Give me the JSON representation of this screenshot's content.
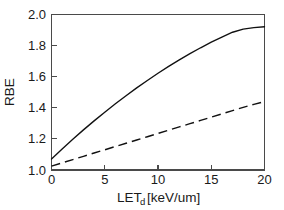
{
  "chart_data": {
    "type": "line",
    "title": "",
    "subtitle": "",
    "xlabel": "LET",
    "xlabel_subscript": "d",
    "xlabel_units": "[keV/um]",
    "ylabel": "RBE",
    "xlim": [
      0,
      20
    ],
    "ylim": [
      1.0,
      2.0
    ],
    "xticks": [
      0,
      5,
      10,
      15,
      20
    ],
    "yticks": [
      1.0,
      1.2,
      1.4,
      1.6,
      1.8,
      2.0
    ],
    "xticklabels": [
      "0",
      "5",
      "10",
      "15",
      "20"
    ],
    "yticklabels": [
      "1.0",
      "1.2",
      "1.4",
      "1.6",
      "1.8",
      "2.0"
    ],
    "grid": false,
    "legend": "none",
    "frame": "box",
    "tick_direction": "in",
    "x": [
      0,
      1,
      2,
      3,
      4,
      5,
      6,
      7,
      8,
      9,
      10,
      11,
      12,
      13,
      14,
      15,
      16,
      17,
      18,
      19,
      20
    ],
    "series": [
      {
        "name": "solid-curve",
        "style": "solid",
        "color": "#111111",
        "values": [
          1.07,
          1.135,
          1.198,
          1.258,
          1.316,
          1.372,
          1.426,
          1.478,
          1.528,
          1.576,
          1.622,
          1.666,
          1.708,
          1.748,
          1.786,
          1.822,
          1.855,
          1.886,
          1.906,
          1.916,
          1.921
        ]
      },
      {
        "name": "dashed-curve",
        "style": "dashed",
        "color": "#111111",
        "values": [
          1.025,
          1.046,
          1.067,
          1.088,
          1.109,
          1.13,
          1.151,
          1.172,
          1.193,
          1.214,
          1.235,
          1.256,
          1.277,
          1.298,
          1.319,
          1.34,
          1.361,
          1.382,
          1.403,
          1.422,
          1.44
        ]
      }
    ]
  },
  "figure": {
    "background_color": "#ffffff",
    "axis_color": "#4a4a4a",
    "line_color": "#111111"
  }
}
